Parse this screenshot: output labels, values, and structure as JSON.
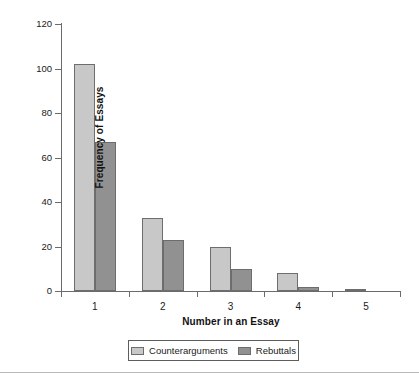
{
  "chart_data": {
    "type": "bar",
    "title": "",
    "xlabel": "Number in an Essay",
    "ylabel": "Frequency of Essays",
    "categories": [
      "1",
      "2",
      "3",
      "4",
      "5"
    ],
    "series": [
      {
        "name": "Counterarguments",
        "color": "#c8c8c8",
        "values": [
          102,
          33,
          20,
          8,
          1
        ]
      },
      {
        "name": "Rebuttals",
        "color": "#919191",
        "values": [
          67,
          23,
          10,
          2,
          0
        ]
      }
    ],
    "ylim": [
      0,
      120
    ],
    "yticks": [
      0,
      20,
      40,
      60,
      80,
      100,
      120
    ],
    "ytick_labels": [
      "0",
      "20",
      "40",
      "60",
      "80",
      "100",
      "120"
    ],
    "grid": false,
    "legend_position": "bottom"
  },
  "axes": {
    "y_title": "Frequency of Essays",
    "x_title": "Number in an Essay",
    "y_tick_labels": [
      "120",
      "100",
      "80",
      "60",
      "40",
      "20",
      "0"
    ],
    "x_tick_labels": [
      "1",
      "2",
      "3",
      "4",
      "5"
    ]
  },
  "legend": {
    "items": [
      {
        "label": "Counterarguments",
        "color": "#c8c8c8"
      },
      {
        "label": "Rebuttals",
        "color": "#919191"
      }
    ]
  },
  "colors": {
    "series_light": "#c8c8c8",
    "series_dark": "#919191",
    "axis": "#6b6b6b",
    "bar_border": "#6d6d6d",
    "rule": "#b9b9b9",
    "background": "#ffffff"
  }
}
